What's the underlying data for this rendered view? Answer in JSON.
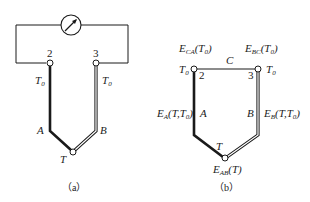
{
  "panel_a": {
    "caption": "（a）",
    "terminal_left": "2",
    "terminal_right": "3",
    "temp_left": "T",
    "temp_left_sub": "0",
    "temp_right": "T",
    "temp_right_sub": "0",
    "wire_left": "A",
    "wire_right": "B",
    "junction": "T",
    "meter_icon": "galvanometer"
  },
  "panel_b": {
    "caption": "（b）",
    "terminal_left": "2",
    "terminal_right": "3",
    "temp_left": "T",
    "temp_left_sub": "0",
    "temp_right": "T",
    "temp_right_sub": "0",
    "wire_left": "A",
    "wire_right": "B",
    "wire_top": "C",
    "junction": "T",
    "emf_ca": {
      "E": "E",
      "sub": "CA",
      "arg": "(T",
      "arg_sub": "0",
      "close": ")"
    },
    "emf_bc": {
      "E": "E",
      "sub": "BC",
      "arg": "(T",
      "arg_sub": "0",
      "close": ")"
    },
    "emf_a": {
      "E": "E",
      "sub": "A",
      "arg": "(T,T",
      "arg_sub": "0",
      "close": ")"
    },
    "emf_b": {
      "E": "E",
      "sub": "B",
      "arg": "(T,T",
      "arg_sub": "0",
      "close": ")"
    },
    "emf_ab": {
      "E": "E",
      "sub": "AB",
      "arg": "(T)"
    }
  },
  "colors": {
    "line": "#1a1a1a",
    "background": "#ffffff"
  }
}
